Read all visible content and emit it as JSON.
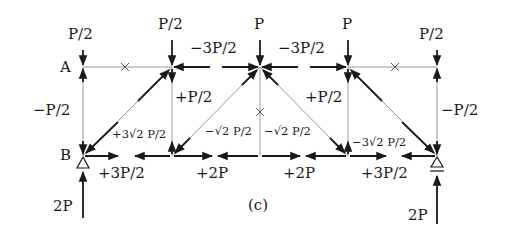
{
  "figure_label": "(c)",
  "nodes": {
    "A": "A",
    "B": "B"
  },
  "loads": {
    "top_A": "P/2",
    "top_2": "P/2",
    "top_3": "P",
    "top_4": "P",
    "top_5": "P/2"
  },
  "reactions": {
    "left": "2P",
    "right": "2P"
  },
  "member_forces": {
    "top_left": "−3P/2",
    "top_right": "−3P/2",
    "vert_left_end": "−P/2",
    "vert_right_end": "−P/2",
    "vert_left_inner": "+P/2",
    "vert_right_inner": "+P/2",
    "diag_left_end": "+3√2 P/2",
    "diag_right_end": "−3√2 P/2",
    "diag_center_left": "−√2 P/2",
    "diag_center_right": "−√2 P/2",
    "bottom_1": "+3P/2",
    "bottom_2": "+2P",
    "bottom_3": "+2P",
    "bottom_4": "+3P/2"
  },
  "zero_members": [
    "×",
    "×",
    "×"
  ],
  "colors": {
    "ink": "#1a1a1a",
    "light_member": "#9a9a9a"
  }
}
